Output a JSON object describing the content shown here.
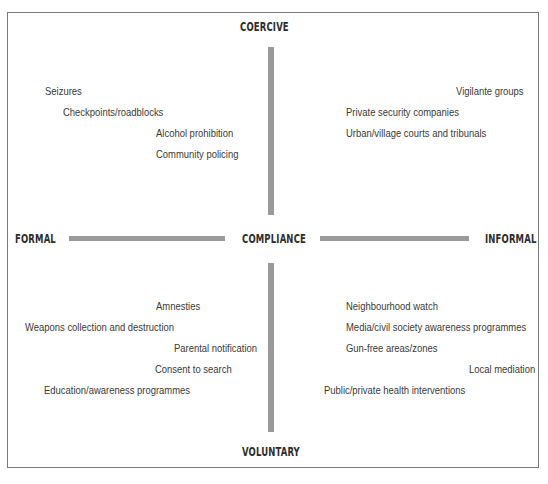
{
  "diagram": {
    "poles": {
      "top": "COERCIVE",
      "bottom": "VOLUNTARY",
      "left": "FORMAL",
      "right": "INFORMAL",
      "center": "COMPLIANCE"
    },
    "quadrants": {
      "coercive_formal": [
        "Seizures",
        "Checkpoints/roadblocks",
        "Alcohol prohibition",
        "Community policing"
      ],
      "coercive_informal": [
        "Vigilante groups",
        "Private security companies",
        "Urban/village courts and tribunals"
      ],
      "voluntary_formal": [
        "Amnesties",
        "Weapons collection and destruction",
        "Parental notification",
        "Consent to search",
        "Education/awareness programmes"
      ],
      "voluntary_informal": [
        "Neighbourhood watch",
        "Media/civil society awareness programmes",
        "Gun-free areas/zones",
        "Local mediation",
        "Public/private health interventions"
      ]
    },
    "colors": {
      "axis_bar": "#9a9a9a",
      "frame": "#7a7a7a",
      "text": "#3a3a3a"
    }
  }
}
